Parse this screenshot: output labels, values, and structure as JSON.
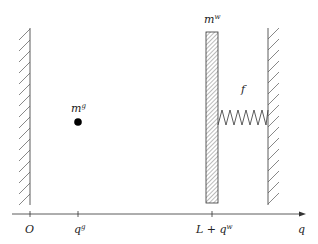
{
  "diagram": {
    "type": "physics-schematic",
    "colors": {
      "stroke": "#333333",
      "hatch": "#555555",
      "point": "#000000",
      "background": "#ffffff"
    },
    "axis": {
      "label": "q",
      "ticks": [
        {
          "id": "origin",
          "label": "O"
        },
        {
          "id": "qg",
          "label_main": "q",
          "label_sup": "g"
        },
        {
          "id": "lqw",
          "label_prefix": "L + ",
          "label_main": "q",
          "label_sup": "w"
        }
      ]
    },
    "point_mass": {
      "label_main": "m",
      "label_sup": "g"
    },
    "wall_mass": {
      "label_main": "m",
      "label_sup": "w"
    },
    "spring": {
      "label": "f"
    },
    "left_wall": {
      "type": "fixed-wall"
    },
    "right_wall": {
      "type": "fixed-wall"
    }
  }
}
